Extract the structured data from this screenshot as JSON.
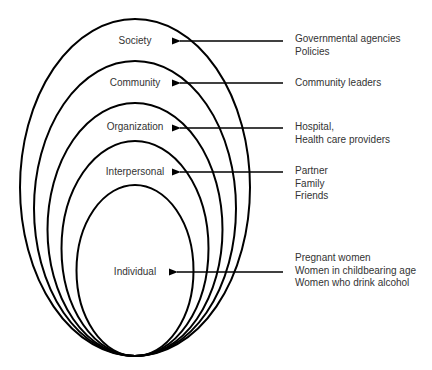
{
  "diagram": {
    "type": "socio-ecological nested ellipses",
    "levels": [
      {
        "name": "Society",
        "targets": [
          "Governmental agencies",
          "Policies"
        ]
      },
      {
        "name": "Community",
        "targets": [
          "Community leaders"
        ]
      },
      {
        "name": "Organization",
        "targets": [
          "Hospital,",
          "Health care providers"
        ]
      },
      {
        "name": "Interpersonal",
        "targets": [
          "Partner",
          "Family",
          "Friends"
        ]
      },
      {
        "name": "Individual",
        "targets": [
          "Pregnant women",
          "Women in childbearing age",
          "Women who drink alcohol"
        ]
      }
    ],
    "colors": {
      "stroke": "#000000",
      "text": "#333333",
      "background": "#ffffff"
    }
  }
}
